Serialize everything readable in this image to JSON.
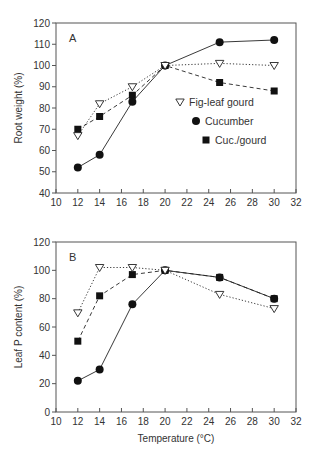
{
  "chart_data": [
    {
      "type": "line",
      "panel": "A",
      "title": "",
      "xlabel": "",
      "ylabel": "Root weight (%)",
      "xlim": [
        10,
        32
      ],
      "ylim": [
        40,
        120
      ],
      "xticks": [
        10,
        12,
        14,
        16,
        18,
        20,
        22,
        24,
        26,
        28,
        30,
        32
      ],
      "yticks": [
        40,
        50,
        60,
        70,
        80,
        90,
        100,
        110,
        120
      ],
      "grid": false,
      "legend_position": "inside-right-middle",
      "x": [
        12,
        14,
        17,
        20,
        25,
        30
      ],
      "series": [
        {
          "name": "Fig-leaf gourd",
          "marker": "triangle-down-open",
          "line": "dotted",
          "values": [
            67,
            82,
            90,
            100,
            101,
            100
          ]
        },
        {
          "name": "Cucumber",
          "marker": "circle-filled",
          "line": "solid",
          "values": [
            52,
            58,
            83,
            100,
            111,
            112
          ]
        },
        {
          "name": "Cuc./gourd",
          "marker": "square-filled",
          "line": "dashed",
          "values": [
            70,
            76,
            86,
            100,
            92,
            88
          ]
        }
      ]
    },
    {
      "type": "line",
      "panel": "B",
      "title": "",
      "xlabel": "Temperature (°C)",
      "ylabel": "Leaf P content (%)",
      "xlim": [
        10,
        32
      ],
      "ylim": [
        0,
        120
      ],
      "xticks": [
        10,
        12,
        14,
        16,
        18,
        20,
        22,
        24,
        26,
        28,
        30,
        32
      ],
      "yticks": [
        0,
        20,
        40,
        60,
        80,
        100,
        120
      ],
      "grid": false,
      "x": [
        12,
        14,
        17,
        20,
        25,
        30
      ],
      "series": [
        {
          "name": "Fig-leaf gourd",
          "marker": "triangle-down-open",
          "line": "dotted",
          "values": [
            70,
            102,
            102,
            100,
            83,
            73
          ]
        },
        {
          "name": "Cucumber",
          "marker": "circle-filled",
          "line": "solid",
          "values": [
            22,
            30,
            76,
            100,
            95,
            80
          ]
        },
        {
          "name": "Cuc./gourd",
          "marker": "square-filled",
          "line": "dashed",
          "values": [
            50,
            82,
            97,
            100,
            95,
            80
          ]
        }
      ]
    }
  ],
  "panels": {
    "a": {
      "letter": "A",
      "ylabel": "Root weight (%)"
    },
    "b": {
      "letter": "B",
      "ylabel": "Leaf P content (%)",
      "xlabel": "Temperature (°C)"
    }
  },
  "legend": {
    "items": [
      "Fig-leaf gourd",
      "Cucumber",
      "Cuc./gourd"
    ]
  }
}
